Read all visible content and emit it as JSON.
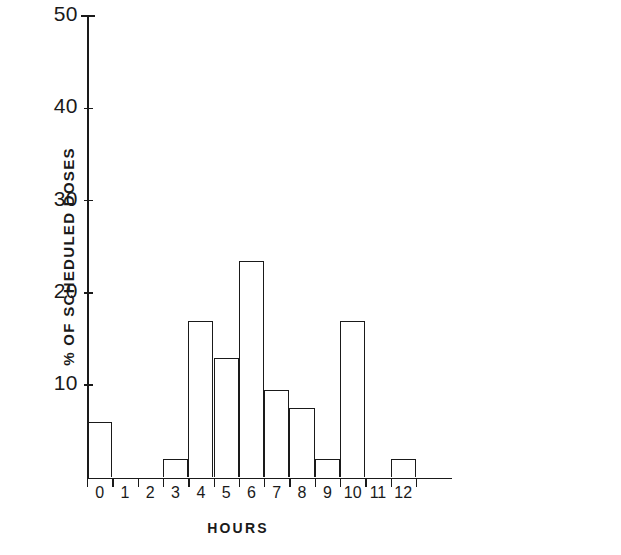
{
  "chart_data": {
    "type": "bar",
    "title": "",
    "subtitle": "",
    "xlabel": "HOURS",
    "ylabel": "% OF SCHEDULED DOSES",
    "categories": [
      "0",
      "1",
      "2",
      "3",
      "4",
      "5",
      "6",
      "7",
      "8",
      "9",
      "10",
      "11",
      "12"
    ],
    "values": [
      6,
      0,
      0,
      2,
      17,
      13,
      23.5,
      9.5,
      7.5,
      2,
      17,
      0,
      2
    ],
    "xlim": [
      -0.5,
      12.5
    ],
    "ylim": [
      0,
      50
    ],
    "ytick_labels": [
      "50",
      "40",
      "30",
      "20",
      "10"
    ],
    "ytick_values": [
      50,
      40,
      30,
      20,
      10
    ],
    "xtick_labels": [
      "0",
      "1",
      "2",
      "3",
      "4",
      "5",
      "6",
      "7",
      "8",
      "9",
      "10",
      "11",
      "12"
    ],
    "grid": false,
    "legend": null,
    "bar_style": "outline",
    "bar_color": "#ffffff",
    "edge_color": "#1a1a1a",
    "annotations": []
  }
}
